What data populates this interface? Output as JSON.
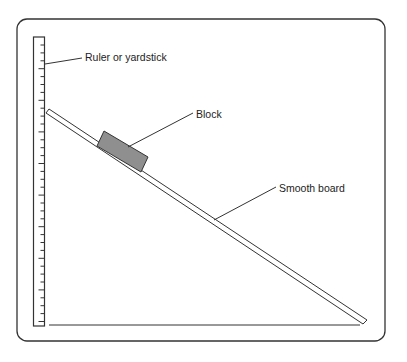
{
  "diagram": {
    "labels": {
      "ruler": "Ruler or yardstick",
      "block": "Block",
      "board": "Smooth board"
    },
    "colors": {
      "stroke": "#333333",
      "block_fill": "#8f8f8f",
      "background": "#ffffff"
    }
  }
}
